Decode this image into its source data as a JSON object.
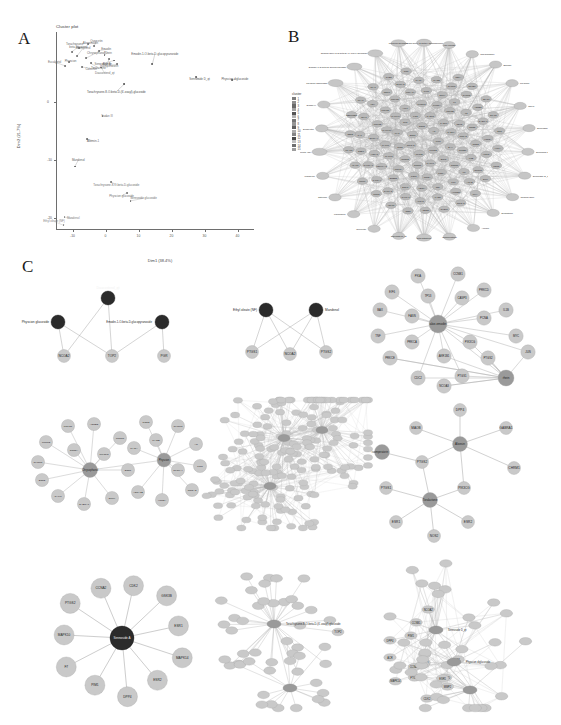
{
  "figure": {
    "panels": [
      {
        "id": "A",
        "letter": "A"
      },
      {
        "id": "B",
        "letter": "B"
      },
      {
        "id": "C",
        "letter": "C"
      }
    ]
  },
  "panelA": {
    "title": "Cluster plot",
    "xlabel": "Dim1 (38.4%)",
    "ylabel": "Dim2 (21.7%)",
    "legend_title": "cluster",
    "legend_items": [
      {
        "label": "1",
        "color": "#7d7d7d"
      },
      {
        "label": "2",
        "color": "#8f8f8f"
      },
      {
        "label": "3",
        "color": "#6a6a6a"
      },
      {
        "label": "4",
        "color": "#a2a2a2"
      },
      {
        "label": "5",
        "color": "#555555"
      },
      {
        "label": "6",
        "color": "#b4b4b4"
      },
      {
        "label": "7",
        "color": "#767676"
      },
      {
        "label": "8",
        "color": "#969696"
      },
      {
        "label": "9",
        "color": "#5f5f5f"
      },
      {
        "label": "10",
        "color": "#adadad"
      },
      {
        "label": "11",
        "color": "#858585"
      },
      {
        "label": "12",
        "color": "#4b4b4b"
      },
      {
        "label": "13",
        "color": "#c0c0c0"
      },
      {
        "label": "14",
        "color": "#6f6f6f"
      },
      {
        "label": "15",
        "color": "#9d9d9d"
      }
    ]
  },
  "chart_data": {
    "type": "scatter",
    "title": "Cluster plot",
    "xlabel": "Dim1 (38.4%)",
    "ylabel": "Dim2 (21.7%)",
    "xlim": [
      -15,
      45
    ],
    "ylim": [
      -22,
      12
    ],
    "xticks": [
      -10,
      0,
      10,
      20,
      30,
      40
    ],
    "yticks": [
      0,
      -10,
      -20
    ],
    "grid": false,
    "legend_position": "right",
    "points": [
      {
        "label": "Torachrysone",
        "x": -7.9,
        "y": 9.3,
        "cluster": 3
      },
      {
        "label": "Aloeemodin",
        "x": -5.3,
        "y": 10.0,
        "cluster": 3
      },
      {
        "label": "beta-sitosterol",
        "x": -10.2,
        "y": 8.6,
        "cluster": 3
      },
      {
        "label": "Quercetin",
        "x": -3.4,
        "y": 9.6,
        "cluster": 3
      },
      {
        "label": "Kaempferol",
        "x": -8.6,
        "y": 7.9,
        "cluster": 3
      },
      {
        "label": "Emodin",
        "x": -2.0,
        "y": 8.8,
        "cluster": 3
      },
      {
        "label": "Chrysophanol",
        "x": -5.9,
        "y": 7.5,
        "cluster": 3
      },
      {
        "label": "Rhein",
        "x": -0.3,
        "y": 8.1,
        "cluster": 3
      },
      {
        "label": "Physcion",
        "x": -11.0,
        "y": 6.9,
        "cluster": 3
      },
      {
        "label": "Aloesin",
        "x": 1.1,
        "y": 7.4,
        "cluster": 3
      },
      {
        "label": "Toralactone",
        "x": -4.4,
        "y": 6.6,
        "cluster": 3
      },
      {
        "label": "Sennoside A",
        "x": 2.6,
        "y": 7.1,
        "cluster": 3
      },
      {
        "label": "Eucalyptol",
        "x": -12.3,
        "y": 6.2,
        "cluster": 3
      },
      {
        "label": "Isoimperatorin",
        "x": 3.6,
        "y": 6.5,
        "cluster": 3
      },
      {
        "label": "Catechin",
        "x": -7.2,
        "y": 6.0,
        "cluster": 3
      },
      {
        "label": "Daucosterol_qt",
        "x": -1.3,
        "y": 5.9,
        "cluster": 3
      },
      {
        "label": "Emodin-1-O-beta-D-glucopyranoside",
        "x": 14.2,
        "y": 6.5,
        "cluster": 5
      },
      {
        "label": "Sennoside D_qt",
        "x": 27.4,
        "y": 4.2,
        "cluster": 5
      },
      {
        "label": "Physcion diglucoside",
        "x": 38.3,
        "y": 3.7,
        "cluster": 5
      },
      {
        "label": "Torachrysone-8-O-beta-D-(6'-oxayl)-glucoside",
        "x": 5.6,
        "y": 3.0,
        "cluster": 12
      },
      {
        "label": "Sudan III",
        "x": -0.9,
        "y": -2.4,
        "cluster": 7
      },
      {
        "label": "Aloesin-1",
        "x": -5.6,
        "y": -6.4,
        "cluster": 9
      },
      {
        "label": "Mandenol",
        "x": -9.3,
        "y": -11.1,
        "cluster": 9
      },
      {
        "label": "Torachrysone-8-O-beta-D-glucoside",
        "x": 1.6,
        "y": -13.7,
        "cluster": 14
      },
      {
        "label": "Physcion glucoside",
        "x": 6.6,
        "y": -15.6,
        "cluster": 14
      },
      {
        "label": "Sennoside glucoside",
        "x": 7.6,
        "y": -17.0,
        "cluster": 14
      },
      {
        "label": "Mandenol",
        "x": -12.4,
        "y": -19.8,
        "cluster": 11
      },
      {
        "label": "Ethyl oleate (NF)",
        "x": -12.7,
        "y": -21.2,
        "cluster": 11
      }
    ]
  },
  "panelB": {
    "description": "Herb-compound-target radial network",
    "hub_label": "Rheum palmatum network",
    "outer_labels": [
      "1,8-dihydroxy-3-methyl-anthraquinone",
      "Aloe-emodin",
      "Chrysophanol",
      "Emodin",
      "Physcion",
      "Rhein",
      "Sennoside A",
      "Sennoside B",
      "Sennoside D_qt",
      "Torachrysone",
      "Toralactone",
      "Aloesin",
      "Isoimperatorin",
      "beta-sitosterol",
      "Daucosterol_qt",
      "Quercetin",
      "Kaempferol",
      "Catechin",
      "Mandenol",
      "Ethyl oleate (NF)",
      "Eucalyptol",
      "Sudan III",
      "Physcion diglucoside",
      "Emodin-1-O-beta-D-glucopyranoside",
      "Torachrysone-8-O-beta-D-(6'-oxayl)-glucoside",
      "Physcion glucoside"
    ],
    "inner_targets": [
      "PTGS2",
      "PTGS1",
      "NCOA2",
      "ESR1",
      "ESR2",
      "AR",
      "PGR",
      "NR3C1",
      "NR3C2",
      "TP53",
      "MYC",
      "JUN",
      "FOS",
      "CASP3",
      "CASP8",
      "CASP9",
      "BAX",
      "BCL2",
      "MAPK1",
      "MAPK3",
      "MAPK8",
      "MAPK10",
      "MAPK14",
      "AKT1",
      "PIK3CG",
      "PIK3CA",
      "GSK3B",
      "CDK2",
      "CCNA2",
      "CCNB1",
      "CCND1",
      "PCNA",
      "TOP2A",
      "TOP2",
      "PRKCA",
      "PRKCB",
      "PRKCD",
      "PRKCE",
      "PRKACA",
      "PIM1",
      "DPP4",
      "F7",
      "F2",
      "NOS2",
      "NOS3",
      "IL1B",
      "IL6",
      "IL10",
      "TNF",
      "VEGFA",
      "EGFR",
      "ERBB2",
      "HSP90AA1",
      "HSPA5",
      "SLC6A4",
      "SLC6A2",
      "MAOA",
      "MAOB",
      "CHRM1",
      "CHRM3",
      "ADRB2",
      "GABRA1",
      "HTR2A",
      "HTR3A",
      "OPRM1",
      "ACHE",
      "AKR1B1",
      "FASN",
      "ALOX5",
      "CYP1A1",
      "CYP1A2",
      "CYP3A4",
      "CYP19A1",
      "SOD1",
      "CAT",
      "GPX1",
      "XDH",
      "ODC1",
      "RELA",
      "NFKB1",
      "STAT1",
      "STAT3",
      "SRC",
      "HIF1A",
      "CDC2",
      "EIF6",
      "PKIA",
      "NCOA3",
      "CHEK1",
      "ABCB1",
      "INSR",
      "IGF1R",
      "MMP2",
      "MMP9",
      "ICAM1",
      "VCAM1",
      "SELE",
      "SERPINE1",
      "PLAU",
      "PLAT",
      "THBD",
      "CRP"
    ]
  },
  "panelC": {
    "subnetworks": [
      {
        "id": "c1",
        "name": "daucosterol-physcion-emodin-glucoside-subnetwork",
        "compounds": [
          "Daucosterol_qt",
          "Physcion glucoside",
          "Emodin-1-O-beta-D-glucopyranoside"
        ],
        "targets": [
          "NCOA2",
          "TOP2",
          "PGR"
        ],
        "edges": [
          [
            "Daucosterol_qt",
            "TOP2"
          ],
          [
            "Daucosterol_qt",
            "NCOA2"
          ],
          [
            "Physcion glucoside",
            "NCOA2"
          ],
          [
            "Physcion glucoside",
            "TOP2"
          ],
          [
            "Emodin-1-O-beta-D-glucopyranoside",
            "TOP2"
          ],
          [
            "Emodin-1-O-beta-D-glucopyranoside",
            "PGR"
          ]
        ]
      },
      {
        "id": "c2",
        "name": "ethyl-oleate-mandenol-subnetwork",
        "compounds": [
          "Ethyl oleate (NF)",
          "Mandenol"
        ],
        "targets": [
          "PTGS1",
          "NCOA2",
          "PTGS2"
        ],
        "edges": [
          [
            "Ethyl oleate (NF)",
            "PTGS1"
          ],
          [
            "Ethyl oleate (NF)",
            "NCOA2"
          ],
          [
            "Ethyl oleate (NF)",
            "PTGS2"
          ],
          [
            "Mandenol",
            "PTGS1"
          ],
          [
            "Mandenol",
            "NCOA2"
          ],
          [
            "Mandenol",
            "PTGS2"
          ]
        ]
      },
      {
        "id": "c3",
        "name": "aloe-emodin-rhein-subnetwork",
        "compounds": [
          "aloe-emodin",
          "rhein"
        ],
        "targets": [
          "PKIA",
          "CCNB1",
          "EIF6",
          "PRKCD",
          "TP53",
          "CASP3",
          "BAX",
          "IL1B",
          "FASN",
          "PCNA",
          "TNF",
          "MYC",
          "PRKCA",
          "PIK3CG",
          "PRKCE",
          "AKR1B1",
          "JUN",
          "PTGS2",
          "CDC2",
          "PTGS1",
          "NCOA3"
        ]
      },
      {
        "id": "c4",
        "name": "two-hub-compound-target-subnetwork",
        "compounds": [
          "Chrysophanol",
          "Physcion"
        ],
        "targets": [
          "PRKG1",
          "ADRB2",
          "PTGS2",
          "PTGS1",
          "CHRM1",
          "CALM",
          "GABRA1",
          "DPP4",
          "ESR1",
          "ESR2",
          "SCN5A",
          "PIK3CG",
          "NOS2",
          "CHRM3",
          "AR",
          "PGR",
          "NCOA2",
          "HTR2A",
          "ADRA1B",
          "SLC6A4",
          "MAOA",
          "MAOB"
        ]
      },
      {
        "id": "c5",
        "name": "large-multi-hub-subnetwork",
        "compounds": [
          "Quercetin",
          "Kaempferol",
          "beta-sitosterol",
          "Emodin"
        ],
        "target_count": 180
      },
      {
        "id": "c6",
        "name": "aloesin-toralactone-subnetwork",
        "compounds": [
          "Aloesin",
          "isoimperatorin",
          "Toralactone"
        ],
        "targets": [
          "DPP4",
          "MAOB",
          "GABRA1",
          "CHRM1",
          "PTGS2",
          "PTGS1",
          "PIK3CG",
          "ESR1",
          "ESR2",
          "NOS2"
        ],
        "edges": [
          [
            "Aloesin",
            "DPP4"
          ],
          [
            "Aloesin",
            "MAOB"
          ],
          [
            "Aloesin",
            "GABRA1"
          ],
          [
            "Aloesin",
            "CHRM1"
          ],
          [
            "Aloesin",
            "PTGS2"
          ],
          [
            "Aloesin",
            "PIK3CG"
          ],
          [
            "isoimperatorin",
            "PTGS2"
          ],
          [
            "Toralactone",
            "PTGS1"
          ],
          [
            "Toralactone",
            "PTGS2"
          ],
          [
            "Toralactone",
            "PIK3CG"
          ],
          [
            "Toralactone",
            "ESR1"
          ],
          [
            "Toralactone",
            "ESR2"
          ],
          [
            "Toralactone",
            "NOS2"
          ]
        ]
      },
      {
        "id": "c7",
        "name": "sennoside-hub-subnetwork",
        "compounds": [
          "Sennoside A"
        ],
        "targets": [
          "CDK2",
          "GSK3B",
          "ESR1",
          "MAPK14",
          "ESR2",
          "DPP4",
          "PIM1",
          "F7",
          "MAPK10",
          "PTGS2",
          "CCNA2"
        ]
      },
      {
        "id": "c8",
        "name": "torachrysone-glucoside-subnetwork",
        "compounds": [
          "Torachrysone-8-O-beta-D-(6'-oxayl)-glucoside",
          "TOP2"
        ],
        "target_count": 46
      },
      {
        "id": "c9",
        "name": "sennoside-d-multi-target-subnetwork",
        "compounds": [
          "Sennoside D_qt",
          "Physcion diglucoside"
        ],
        "targets": [
          "ACR",
          "MAPK14",
          "TP53",
          "CCNA1",
          "GSK3B",
          "CDK2",
          "NCOA2",
          "PIM1",
          "PRKCD",
          "F7",
          "PTGS2",
          "ESR1",
          "DPP4",
          "CCNB1",
          "MMP2"
        ],
        "target_count": 52
      }
    ]
  }
}
